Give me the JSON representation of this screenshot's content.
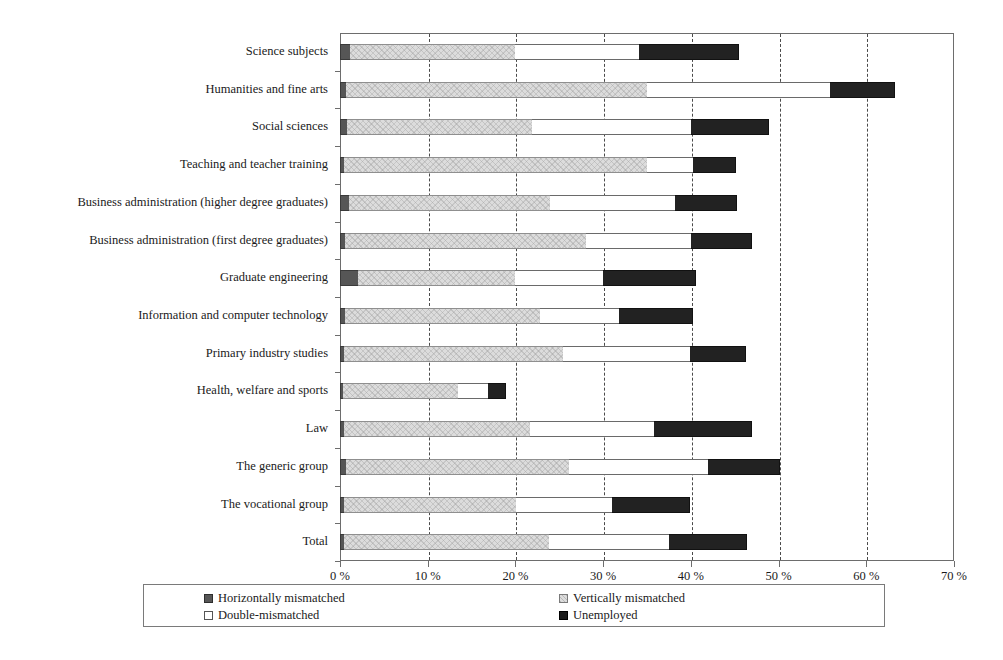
{
  "chart_data": {
    "type": "bar",
    "orientation": "horizontal",
    "stacked": true,
    "title": "",
    "subtitle": "",
    "xlabel": "",
    "ylabel": "",
    "xlim": [
      0,
      70
    ],
    "xticks": [
      0,
      10,
      20,
      30,
      40,
      50,
      60,
      70
    ],
    "xtick_labels": [
      "0 %",
      "10 %",
      "20 %",
      "30 %",
      "40 %",
      "50 %",
      "60 %",
      "70 %"
    ],
    "grid": "vertical-dashed",
    "legend_position": "bottom",
    "categories": [
      "Science subjects",
      "Humanities and fine arts",
      "Social sciences",
      "Teaching and teacher training",
      "Business administration (higher degree graduates)",
      "Business administration (first degree graduates)",
      "Graduate engineering",
      "Information and computer technology",
      "Primary industry studies",
      "Health, welfare and sports",
      "Law",
      "The generic group",
      "The vocational group",
      "Total"
    ],
    "series": [
      {
        "name": "Horizontally mismatched",
        "color": "#565656",
        "values": [
          1.1,
          0.7,
          0.8,
          0.5,
          1.0,
          0.6,
          2.1,
          0.6,
          0.4,
          0.3,
          0.4,
          0.7,
          0.5,
          0.5
        ]
      },
      {
        "name": "Vertically mismatched",
        "color": "#dcdcdc",
        "values": [
          18.8,
          34.3,
          21.1,
          34.5,
          22.9,
          27.5,
          17.8,
          22.2,
          25.0,
          13.2,
          21.3,
          25.4,
          19.6,
          23.3
        ]
      },
      {
        "name": "Double-mismatched",
        "color": "#ffffff",
        "values": [
          14.2,
          20.9,
          18.1,
          5.3,
          14.3,
          11.9,
          10.1,
          9.0,
          14.5,
          3.4,
          14.1,
          15.9,
          10.9,
          13.7
        ]
      },
      {
        "name": "Unemployed",
        "color": "#222222",
        "values": [
          11.4,
          7.4,
          8.9,
          4.9,
          7.1,
          7.0,
          10.6,
          8.4,
          6.4,
          2.0,
          11.2,
          8.2,
          8.9,
          8.9
        ]
      }
    ],
    "cumulative_totals": [
      45.5,
      63.3,
      48.9,
      45.2,
      45.3,
      47.0,
      40.6,
      40.2,
      46.3,
      18.9,
      47.0,
      50.2,
      39.9,
      46.4
    ]
  },
  "legend": {
    "items": [
      {
        "label": "Horizontally mismatched",
        "swatch": "horiz"
      },
      {
        "label": "Vertically mismatched",
        "swatch": "vert"
      },
      {
        "label": "Double-mismatched",
        "swatch": "dbl"
      },
      {
        "label": "Unemployed",
        "swatch": "unemp"
      }
    ]
  },
  "colors": {
    "horizontally_mismatched": "#565656",
    "vertically_mismatched": "#dcdcdc",
    "double_mismatched": "#ffffff",
    "unemployed": "#222222",
    "axis": "#6d6d6d",
    "gridline": "#4a4a4a"
  }
}
